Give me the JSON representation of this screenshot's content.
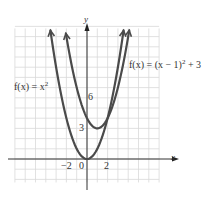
{
  "chart_data": {
    "type": "line",
    "title": "",
    "xlabel": "x",
    "ylabel": "y",
    "xlim": [
      -7,
      7
    ],
    "ylim": [
      -2,
      13
    ],
    "grid": true,
    "x_ticks_labeled": [
      "-2",
      "0",
      "2"
    ],
    "y_ticks_labeled": [
      "3",
      "6"
    ],
    "series": [
      {
        "name": "f(x) = x^2",
        "label": "f(x) = x",
        "label_sup": "2",
        "formula": "x^2",
        "vertex": [
          0,
          0
        ],
        "x": [
          -3.5,
          -3,
          -2,
          -1,
          0,
          1,
          2,
          3,
          3.5
        ],
        "y": [
          12.25,
          9,
          4,
          1,
          0,
          1,
          4,
          9,
          12.25
        ],
        "color": "#4a4a4a"
      },
      {
        "name": "f(x) = (x - 1)^2 + 3",
        "label": "f(x) = (x − 1)",
        "label_sup": "2",
        "label_tail": " + 3",
        "formula": "(x-1)^2 + 3",
        "vertex": [
          1,
          3
        ],
        "x": [
          -2,
          -1,
          0,
          1,
          2,
          3,
          4
        ],
        "y": [
          12,
          7,
          4,
          3,
          4,
          7,
          12
        ],
        "color": "#4a4a4a"
      }
    ]
  },
  "labels": {
    "axis_x": "x",
    "axis_y": "y",
    "tick_neg2": "−2",
    "tick_0": "0",
    "tick_2": "2",
    "tick_3": "3",
    "tick_6": "6",
    "eq1_main": "f(x) = x",
    "eq1_sup": "2",
    "eq2_main": "f(x) = (x − 1)",
    "eq2_sup": "2",
    "eq2_tail": " + 3"
  }
}
